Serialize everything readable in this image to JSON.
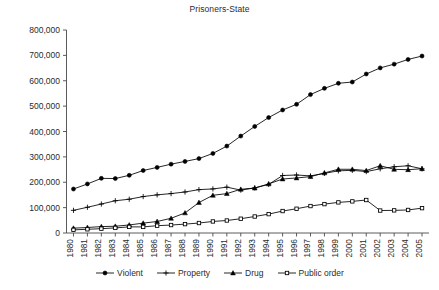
{
  "chart_data": {
    "type": "line",
    "title": "Prisoners-State",
    "xlabel": "",
    "ylabel": "",
    "ylim": [
      0,
      800000
    ],
    "yticks": [
      0,
      100000,
      200000,
      300000,
      400000,
      500000,
      600000,
      700000,
      800000
    ],
    "ytick_labels": [
      "0",
      "100,000",
      "200,000",
      "300,000",
      "400,000",
      "500,000",
      "600,000",
      "700,000",
      "800,000"
    ],
    "grid": false,
    "legend_position": "bottom",
    "categories": [
      "1980",
      "1981",
      "1982",
      "1983",
      "1984",
      "1985",
      "1986",
      "1987",
      "1988",
      "1989",
      "1990",
      "1991",
      "1992",
      "1993",
      "1994",
      "1995",
      "1996",
      "1997",
      "1998",
      "1999",
      "2000",
      "2001",
      "2002",
      "2003",
      "2004",
      "2005"
    ],
    "series": [
      {
        "name": "Violent",
        "marker": "filled-circle",
        "values": [
          173300,
          193300,
          215300,
          214600,
          227300,
          246200,
          258600,
          271300,
          282105,
          293200,
          313600,
          342500,
          382000,
          420000,
          455000,
          484800,
          507100,
          545500,
          570000,
          590000,
          595000,
          626600,
          650600,
          665500,
          684000,
          697400
        ]
      },
      {
        "name": "Property",
        "marker": "plus",
        "values": [
          89300,
          101400,
          114200,
          127100,
          133100,
          143600,
          150300,
          155300,
          161600,
          170900,
          173700,
          180700,
          169000,
          177700,
          191600,
          226600,
          228600,
          225000,
          235000,
          245000,
          247000,
          242000,
          253000,
          261000,
          265000,
          253000
        ]
      },
      {
        "name": "Drug",
        "marker": "filled-triangle",
        "values": [
          19000,
          21700,
          25300,
          26600,
          31700,
          38900,
          45400,
          57900,
          79100,
          120100,
          148600,
          155200,
          172300,
          177000,
          193500,
          212800,
          216900,
          222100,
          236800,
          251200,
          251100,
          246100,
          265100,
          250900,
          249400,
          253300
        ]
      },
      {
        "name": "Public order",
        "marker": "open-square",
        "values": [
          12400,
          14600,
          17100,
          20100,
          24100,
          24000,
          28800,
          31300,
          35000,
          39300,
          45500,
          49200,
          56300,
          65000,
          74400,
          86500,
          95600,
          106200,
          113900,
          120600,
          124600,
          130000,
          88500,
          89200,
          90800,
          98000
        ]
      }
    ]
  },
  "legend": {
    "items": [
      {
        "label": "Violent",
        "marker": "filled-circle"
      },
      {
        "label": "Property",
        "marker": "plus"
      },
      {
        "label": "Drug",
        "marker": "filled-triangle"
      },
      {
        "label": "Public order",
        "marker": "open-square"
      }
    ]
  },
  "colors": {
    "series": "#000000",
    "axis": "#4a4a4a",
    "text": "#2b2b2b",
    "background": "#ffffff"
  }
}
